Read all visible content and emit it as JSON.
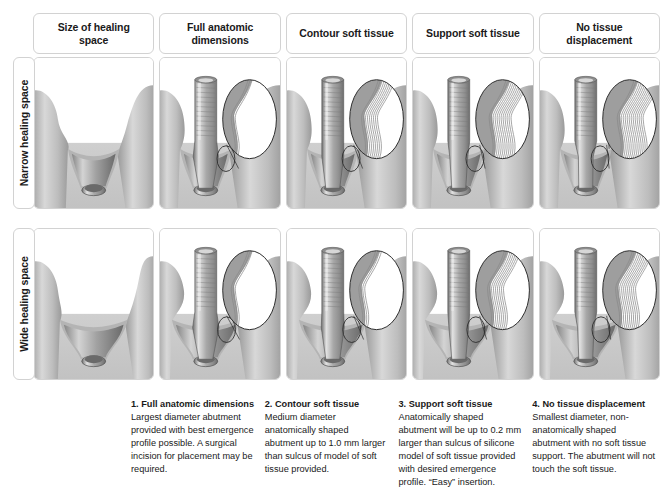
{
  "figure": {
    "type": "comparison-matrix"
  },
  "columns": [
    {
      "key": "size",
      "header": "Size of healing\nspace"
    },
    {
      "key": "full",
      "header": "Full anatomic\ndimensions"
    },
    {
      "key": "contour",
      "header": "Contour soft tissue"
    },
    {
      "key": "support",
      "header": "Support soft tissue"
    },
    {
      "key": "none",
      "header": "No tissue displacement"
    }
  ],
  "rows": [
    {
      "key": "narrow",
      "label": "Narrow healing space"
    },
    {
      "key": "wide",
      "label": "Wide healing space"
    }
  ],
  "cells": {
    "narrow": {
      "size": {
        "has_abutment": false,
        "has_inset": false,
        "gap": "narrow",
        "abutment_width": 0,
        "hatch_lines": 0
      },
      "full": {
        "has_abutment": true,
        "has_inset": true,
        "gap": "narrow",
        "abutment_width": 46,
        "hatch_lines": 3
      },
      "contour": {
        "has_abutment": true,
        "has_inset": true,
        "gap": "narrow",
        "abutment_width": 40,
        "hatch_lines": 9
      },
      "support": {
        "has_abutment": true,
        "has_inset": true,
        "gap": "narrow",
        "abutment_width": 33,
        "hatch_lines": 12
      },
      "none": {
        "has_abutment": true,
        "has_inset": true,
        "gap": "narrow",
        "abutment_width": 27,
        "hatch_lines": 14
      }
    },
    "wide": {
      "size": {
        "has_abutment": false,
        "has_inset": false,
        "gap": "wide",
        "abutment_width": 0,
        "hatch_lines": 0
      },
      "full": {
        "has_abutment": true,
        "has_inset": true,
        "gap": "wide",
        "abutment_width": 48,
        "hatch_lines": 3
      },
      "contour": {
        "has_abutment": true,
        "has_inset": true,
        "gap": "wide",
        "abutment_width": 42,
        "hatch_lines": 4
      },
      "support": {
        "has_abutment": true,
        "has_inset": true,
        "gap": "wide",
        "abutment_width": 36,
        "hatch_lines": 9
      },
      "none": {
        "has_abutment": true,
        "has_inset": true,
        "gap": "wide",
        "abutment_width": 30,
        "hatch_lines": 11
      }
    }
  },
  "captions": [
    {
      "title": "1. Full anatomic dimensions",
      "body": "Largest diameter abutment provided with best emergence profile possible. A surgical incision for placement may be required."
    },
    {
      "title": "2. Contour soft tissue",
      "body": "Medium diameter anatomically shaped abutment up to 1.0 mm larger than sulcus of model of soft tissue provided."
    },
    {
      "title": "3. Support soft tissue",
      "body": "Anatomically shaped abutment will be up to 0.2 mm larger than sulcus of silicone model of soft tissue provided with desired emergence profile. “Easy” insertion."
    },
    {
      "title": "4. No tissue displacement",
      "body": "Smallest diameter, non-anatomically shaped abutment with no soft tissue support. The abutment will not touch the soft tissue."
    }
  ],
  "colors": {
    "border": "#d2d2d2",
    "tissue_light": "#d8d8d8",
    "tissue_mid": "#bdbdbd",
    "tissue_dark": "#9a9a9a",
    "metal_light": "#e2e2e2",
    "metal_mid": "#a8a8a8",
    "metal_dark": "#6e6e6e",
    "background": "#ffffff",
    "text": "#1a1a1a"
  }
}
